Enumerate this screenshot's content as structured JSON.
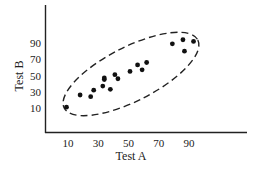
{
  "chart_data": {
    "type": "scatter",
    "title": "",
    "xlabel": "Test A",
    "ylabel": "Test B",
    "x_ticks": [
      10,
      30,
      50,
      70,
      90
    ],
    "y_ticks": [
      10,
      30,
      50,
      70,
      90
    ],
    "xlim": [
      0,
      115
    ],
    "ylim": [
      -8,
      112
    ],
    "grid": false,
    "legend": null,
    "points": [
      {
        "x": 9,
        "y": 11
      },
      {
        "x": 18,
        "y": 26
      },
      {
        "x": 25,
        "y": 24
      },
      {
        "x": 27,
        "y": 32
      },
      {
        "x": 33,
        "y": 37
      },
      {
        "x": 34,
        "y": 45
      },
      {
        "x": 34,
        "y": 47
      },
      {
        "x": 38,
        "y": 33
      },
      {
        "x": 41,
        "y": 51
      },
      {
        "x": 43,
        "y": 46
      },
      {
        "x": 51,
        "y": 55
      },
      {
        "x": 56,
        "y": 63
      },
      {
        "x": 59,
        "y": 57
      },
      {
        "x": 62,
        "y": 66
      },
      {
        "x": 79,
        "y": 89
      },
      {
        "x": 86,
        "y": 94
      },
      {
        "x": 87,
        "y": 80
      },
      {
        "x": 93,
        "y": 92
      }
    ],
    "annotations": [
      {
        "type": "dashed-ellipse",
        "description": "enclosing the point cloud along the positive correlation"
      }
    ]
  }
}
